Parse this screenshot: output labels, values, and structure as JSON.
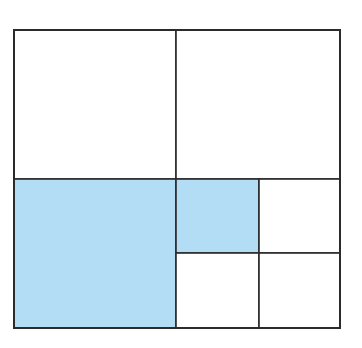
{
  "diagram": {
    "type": "area-model-square-partition",
    "colors": {
      "shaded": "#B3DDF5",
      "unshaded": "#FFFFFF",
      "line": "#2B2B2B"
    },
    "outer": {
      "x": 14,
      "y": 30,
      "width": 326,
      "height": 298
    },
    "cells": [
      {
        "id": "top-left-quarter",
        "x": 14,
        "y": 30,
        "width": 162,
        "height": 149,
        "shaded": false
      },
      {
        "id": "top-right-quarter",
        "x": 176,
        "y": 30,
        "width": 164,
        "height": 149,
        "shaded": false
      },
      {
        "id": "bottom-left-quarter",
        "x": 14,
        "y": 179,
        "width": 162,
        "height": 149,
        "shaded": true
      },
      {
        "id": "bottom-right-sub-top-left",
        "x": 176,
        "y": 179,
        "width": 83,
        "height": 74,
        "shaded": true
      },
      {
        "id": "bottom-right-sub-top-right",
        "x": 259,
        "y": 179,
        "width": 81,
        "height": 74,
        "shaded": false
      },
      {
        "id": "bottom-right-sub-bottom-left",
        "x": 176,
        "y": 253,
        "width": 83,
        "height": 75,
        "shaded": false
      },
      {
        "id": "bottom-right-sub-bottom-right",
        "x": 259,
        "y": 253,
        "width": 81,
        "height": 75,
        "shaded": false
      }
    ],
    "shaded_fraction": "5/16"
  }
}
